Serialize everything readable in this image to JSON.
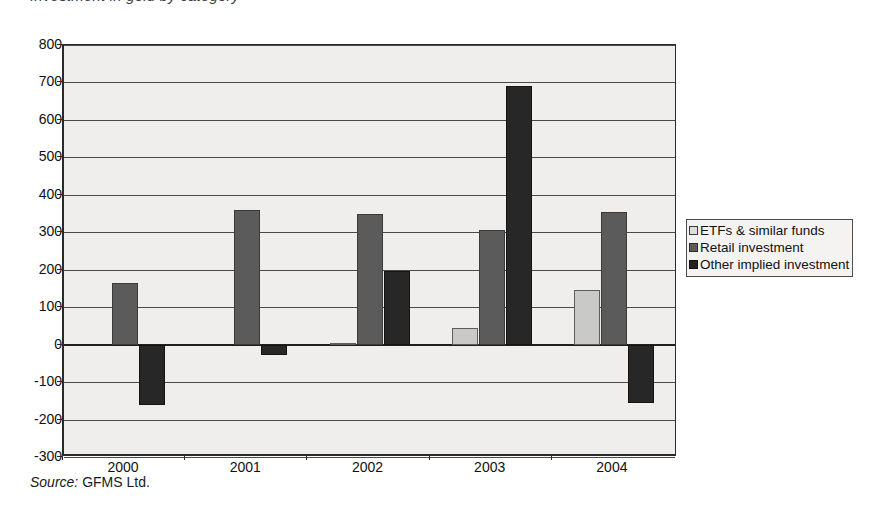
{
  "figure": {
    "title": "Investment in gold by category",
    "source_prefix": "Source:",
    "source_value": "GFMS Ltd."
  },
  "legend": {
    "position": "right",
    "items": [
      {
        "label": "ETFs  & similar funds",
        "key": "etf",
        "color": "#dcdcda"
      },
      {
        "label": "Retail investment",
        "key": "retail",
        "color": "#5b5b5b"
      },
      {
        "label": "Other implied investment",
        "key": "other",
        "color": "#222222"
      }
    ]
  },
  "chart_data": {
    "type": "bar",
    "title": "Investment in gold by category",
    "xlabel": "",
    "ylabel": "",
    "categories": [
      "2000",
      "2001",
      "2002",
      "2003",
      "2004"
    ],
    "ylim": [
      -300,
      800
    ],
    "ytick_step": 100,
    "yticks": [
      800,
      700,
      600,
      500,
      400,
      300,
      200,
      100,
      0,
      -100,
      -200,
      -300
    ],
    "ytick_labels": [
      "800",
      "700",
      "600",
      "500",
      "400",
      "300",
      "200",
      "100",
      "0",
      "-100",
      "-200",
      "-300"
    ],
    "grid": true,
    "legend_position": "right",
    "series": [
      {
        "name": "ETFs  & similar funds",
        "color": "#dcdcda",
        "values": [
          0,
          0,
          5,
          45,
          145
        ]
      },
      {
        "name": "Retail investment",
        "color": "#5b5b5b",
        "values": [
          165,
          360,
          348,
          305,
          355
        ]
      },
      {
        "name": "Other implied investment",
        "color": "#222222",
        "values": [
          -160,
          -28,
          197,
          690,
          -155
        ]
      }
    ],
    "source": "Source: GFMS Ltd."
  }
}
